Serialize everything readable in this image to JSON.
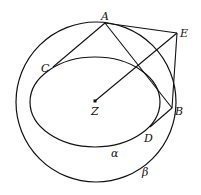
{
  "diagram": {
    "colors": {
      "stroke": "#111111",
      "background": "#ffffff"
    },
    "circle_beta": {
      "cx": 96,
      "cy": 102,
      "r": 80,
      "label": "β"
    },
    "ellipse_alpha": {
      "cx": 95,
      "cy": 102,
      "rx": 65,
      "ry": 45,
      "label": "α"
    },
    "points": {
      "A": {
        "x": 105,
        "y": 23,
        "label": "A"
      },
      "E": {
        "x": 177,
        "y": 33,
        "label": "E"
      },
      "B": {
        "x": 172,
        "y": 108,
        "label": "B"
      },
      "C": {
        "x": 53,
        "y": 67,
        "label": "C"
      },
      "D": {
        "x": 150,
        "y": 127,
        "label": "D"
      },
      "Z": {
        "x": 95,
        "y": 101,
        "label": "Z"
      }
    },
    "segments": [
      [
        "A",
        "C"
      ],
      [
        "A",
        "B"
      ],
      [
        "A",
        "E"
      ],
      [
        "E",
        "B"
      ],
      [
        "B",
        "D"
      ],
      [
        "Z",
        "E"
      ]
    ]
  }
}
